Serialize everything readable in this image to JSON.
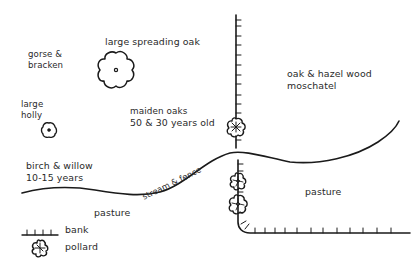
{
  "map": {
    "labels": {
      "large_spreading_oak": "large spreading oak",
      "gorse_line1": "gorse &",
      "gorse_line2": "bracken",
      "holly_line1": "large",
      "holly_line2": "holly",
      "maiden_line1": "maiden oaks",
      "maiden_line2": "50 & 30 years old",
      "oakhazel_line1": "oak & hazel wood",
      "oakhazel_line2": "moschatel",
      "birch_line1": "birch & willow",
      "birch_line2": "10-15 years",
      "stream": "stream & fence",
      "pasture_left": "pasture",
      "pasture_right": "pasture"
    },
    "features": [
      {
        "type": "tree",
        "name": "large spreading oak"
      },
      {
        "type": "tree",
        "name": "large holly"
      },
      {
        "type": "pollard",
        "count": 3
      },
      {
        "type": "bank",
        "segments": 2
      },
      {
        "type": "stream",
        "name": "stream & fence"
      }
    ],
    "colors": {
      "ink": "#1a1a1a",
      "background": "#ffffff"
    }
  },
  "legend": {
    "bank_label": "bank",
    "pollard_label": "pollard"
  }
}
